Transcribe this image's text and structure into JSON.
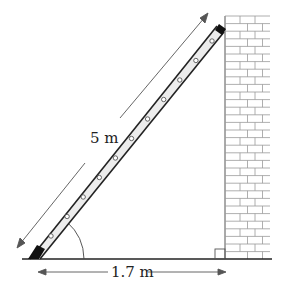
{
  "diagram": {
    "labels": {
      "ladder_length": "5 m",
      "base_distance": "1.7 m"
    },
    "elements": {
      "ladder": {
        "rungs": 11
      },
      "wall": {
        "type": "brick"
      },
      "angle_marker": "angle between ladder and ground",
      "right_angle_marker": "wall meets ground at right angle"
    },
    "colors": {
      "line": "#222222",
      "ladder_fill": "#e6e6e6",
      "brick_line": "#8a8a8a",
      "arrow": "#555555"
    }
  }
}
